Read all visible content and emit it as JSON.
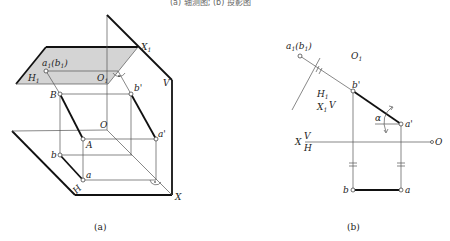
{
  "top_caption": "(a) 轴测图; (b) 投影图",
  "figure_a": {
    "caption": "(a)",
    "labels": {
      "X1": "X",
      "X1_sub": "1",
      "a1b1": "a",
      "a1b1_sub": "1",
      "a1b1_rest": "(b",
      "a1b1_sub2": "1",
      "a1b1_close": ")",
      "H1": "H",
      "H1_sub": "1",
      "O1": "O",
      "O1_sub": "1",
      "V": "V",
      "B": "B",
      "b_prime": "b'",
      "O": "O",
      "a_prime": "a'",
      "A": "A",
      "b": "b",
      "a": "a",
      "H": "H",
      "X": "X"
    },
    "colors": {
      "h1_plane_fill": "#d4d4d4",
      "line": "#111111"
    }
  },
  "figure_b": {
    "caption": "(b)",
    "labels": {
      "a1b1": "a",
      "a1b1_sub": "1",
      "a1b1_rest": "(b",
      "a1b1_sub2": "1",
      "a1b1_close": ")",
      "O1": "O",
      "O1_sub": "1",
      "b_prime": "b'",
      "H1": "H",
      "H1_sub": "1",
      "X1": "X",
      "X1_sub": "1",
      "V_small": "V",
      "alpha": "α",
      "a_prime": "a'",
      "X": "X",
      "V": "V",
      "H": "H",
      "O": "O",
      "b": "b",
      "a": "a"
    }
  }
}
